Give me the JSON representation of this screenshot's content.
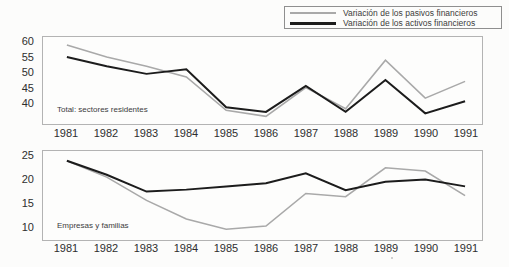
{
  "legend": {
    "items": [
      {
        "label": "Variación de los pasivos financieros",
        "color": "#a9a9a9"
      },
      {
        "label": "Variación de los activos financieros",
        "color": "#1c1c1c"
      }
    ]
  },
  "colors": {
    "pasivos_line": "#a9a9a9",
    "activos_line": "#1c1c1c",
    "plot_border": "#b3b3b3",
    "text": "#2e2e2e"
  },
  "chart_data": [
    {
      "type": "line",
      "title": "Total: sectores residentes",
      "x": [
        1981,
        1982,
        1983,
        1984,
        1985,
        1986,
        1987,
        1988,
        1989,
        1990,
        1991
      ],
      "xlabel": "",
      "ylabel": "",
      "y_ticks": [
        60,
        55,
        50,
        45,
        40
      ],
      "ylim": [
        33,
        61.6
      ],
      "grid": false,
      "legend_position": "top-right-outside",
      "series": [
        {
          "name": "Variación de los pasivos financieros",
          "color": "#a9a9a9",
          "values": [
            59,
            55,
            52,
            48.5,
            37.5,
            35.5,
            45,
            38,
            54,
            41.5,
            47
          ]
        },
        {
          "name": "Variación de los activos financieros",
          "color": "#1c1c1c",
          "values": [
            55,
            52,
            49.5,
            51,
            38.5,
            37,
            45.5,
            37,
            47.5,
            36.5,
            40.5
          ]
        }
      ]
    },
    {
      "type": "line",
      "title": "Empresas y familias",
      "x": [
        1981,
        1982,
        1983,
        1984,
        1985,
        1986,
        1987,
        1988,
        1989,
        1990,
        1991
      ],
      "xlabel": "",
      "ylabel": "",
      "y_ticks": [
        25,
        20,
        15,
        10
      ],
      "ylim": [
        7,
        26.1
      ],
      "grid": false,
      "legend_position": "top-right-outside",
      "series": [
        {
          "name": "Variación de los pasivos financieros",
          "color": "#a9a9a9",
          "values": [
            24,
            20.5,
            15.5,
            11.5,
            9.3,
            10,
            17,
            16.3,
            22.5,
            21.8,
            16.5
          ]
        },
        {
          "name": "Variación de los activos financieros",
          "color": "#1c1c1c",
          "values": [
            24,
            21,
            17.4,
            17.8,
            18.5,
            19.2,
            21.3,
            17.7,
            19.5,
            20,
            18.5
          ]
        }
      ]
    }
  ]
}
